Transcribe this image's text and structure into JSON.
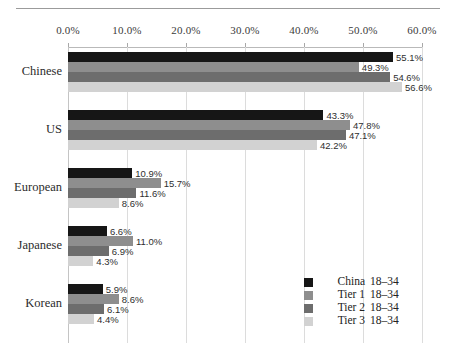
{
  "chart_data": {
    "type": "bar",
    "orientation": "horizontal",
    "title": "",
    "subtitle": "",
    "xlabel": "",
    "ylabel": "",
    "xlim": [
      0,
      60
    ],
    "xtick_labels": [
      "0.0%",
      "10.0%",
      "20.0%",
      "30.0%",
      "40.0%",
      "50.0%",
      "60.0%"
    ],
    "xticks": [
      0,
      10,
      20,
      30,
      40,
      50,
      60
    ],
    "grid": true,
    "legend_position": "bottom-right",
    "categories": [
      "Chinese",
      "US",
      "European",
      "Japanese",
      "Korean"
    ],
    "series": [
      {
        "name": "China",
        "age": "18–34",
        "color": "#161616",
        "values": [
          55.1,
          43.3,
          10.9,
          6.6,
          5.9
        ],
        "labels": [
          "55.1%",
          "43.3%",
          "10.9%",
          "6.6%",
          "5.9%"
        ]
      },
      {
        "name": "Tier 1",
        "age": "18–34",
        "color": "#8e8e8e",
        "values": [
          49.3,
          47.8,
          15.7,
          11.0,
          8.6
        ],
        "labels": [
          "49.3%",
          "47.8%",
          "15.7%",
          "11.0%",
          "8.6%"
        ]
      },
      {
        "name": "Tier 2",
        "age": "18–34",
        "color": "#6d6d6d",
        "values": [
          54.6,
          47.1,
          11.6,
          6.9,
          6.1
        ],
        "labels": [
          "54.6%",
          "47.1%",
          "11.6%",
          "6.9%",
          "6.1%"
        ]
      },
      {
        "name": "Tier 3",
        "age": "18–34",
        "color": "#d2d2d2",
        "values": [
          56.6,
          42.2,
          8.6,
          4.3,
          4.4
        ],
        "labels": [
          "56.6%",
          "42.2%",
          "8.6%",
          "4.3%",
          "4.4%"
        ]
      }
    ]
  },
  "axis": {
    "ticks": [
      "0.0%",
      "10.0%",
      "20.0%",
      "30.0%",
      "40.0%",
      "50.0%",
      "60.0%"
    ]
  },
  "categories": [
    "Chinese",
    "US",
    "European",
    "Japanese",
    "Korean"
  ],
  "legend": {
    "items": [
      {
        "name": "China",
        "age": "18–34",
        "color": "#161616"
      },
      {
        "name": "Tier 1",
        "age": "18–34",
        "color": "#8e8e8e"
      },
      {
        "name": "Tier 2",
        "age": "18–34",
        "color": "#6d6d6d"
      },
      {
        "name": "Tier 3",
        "age": "18–34",
        "color": "#d2d2d2"
      }
    ]
  }
}
